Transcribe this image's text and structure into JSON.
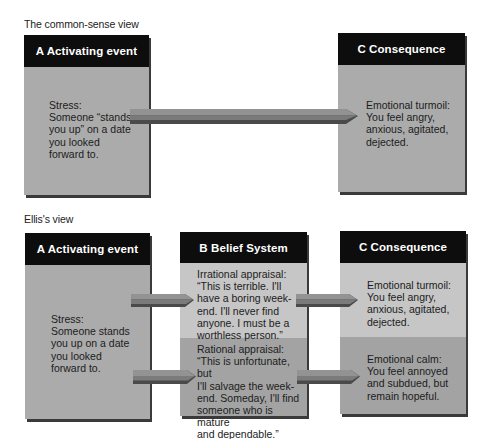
{
  "common_sense_view": {
    "label": "The common-sense view",
    "activating_event": {
      "header": "A  Activating event",
      "text": "Stress:\nSomeone “stands\nyou up” on a date\nyou looked\nforward to."
    },
    "consequence": {
      "header": "C  Consequence",
      "text": "Emotional turmoil:\nYou feel angry,\nanxious, agitated,\ndejected."
    }
  },
  "ellis_view": {
    "label": "Ellis's view",
    "activating_event": {
      "header": "A  Activating event",
      "text": "Stress:\nSomeone stands\nyou up on a date\nyou looked\nforward to."
    },
    "belief_system": {
      "header": "B  Belief System",
      "irrational": "Irrational appraisal:\n“This is terrible. I'll\nhave a boring week-\nend. I'll never find\nanyone. I must be a\nworthless person.”",
      "rational": "Rational appraisal:\n“This is unfortunate, but\nI'll salvage the week-\nend. Someday, I'll find\nsomeone who is mature\nand dependable.”"
    },
    "consequence": {
      "header": "C  Consequence",
      "turmoil": "Emotional turmoil:\nYou feel angry,\nanxious, agitated,\ndejected.",
      "calm": "Emotional calm:\nYou feel annoyed\nand subdued, but\nremain hopeful."
    }
  },
  "colors": {
    "header_bg": "#0d0d0d",
    "header_text": "#ffffff",
    "panel_mid": "#ababab",
    "panel_light": "#c6c6c6",
    "panel_dark": "#a3a3a3",
    "arrow_top": "#8e8e8e",
    "arrow_bottom": "#4a4a4a"
  }
}
